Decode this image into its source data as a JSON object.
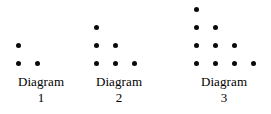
{
  "figure": {
    "background_color": "#ffffff",
    "dot_color": "#0a0a0a",
    "dot_diameter_px": 5,
    "row_spacing_px": 18,
    "column_spacing_px": 19,
    "caption_label": "Diagram",
    "diagrams": [
      {
        "name": "diagram-1",
        "caption_word": "Diagram",
        "caption_number": "1",
        "origin_x": 18,
        "rows": [
          {
            "count": 1,
            "y": 45,
            "xs": [
              18
            ]
          },
          {
            "count": 2,
            "y": 63,
            "xs": [
              18,
              37
            ]
          }
        ],
        "total_dots": 3
      },
      {
        "name": "diagram-2",
        "caption_word": "Diagram",
        "caption_number": "2",
        "origin_x": 96,
        "rows": [
          {
            "count": 1,
            "y": 27,
            "xs": [
              96
            ]
          },
          {
            "count": 2,
            "y": 45,
            "xs": [
              96,
              115
            ]
          },
          {
            "count": 3,
            "y": 63,
            "xs": [
              96,
              115,
              134
            ]
          }
        ],
        "total_dots": 6
      },
      {
        "name": "diagram-3",
        "caption_word": "Diagram",
        "caption_number": "3",
        "origin_x": 196,
        "rows": [
          {
            "count": 1,
            "y": 9,
            "xs": [
              196
            ]
          },
          {
            "count": 2,
            "y": 27,
            "xs": [
              196,
              215
            ]
          },
          {
            "count": 3,
            "y": 45,
            "xs": [
              196,
              215,
              234
            ]
          },
          {
            "count": 4,
            "y": 63,
            "xs": [
              196,
              215,
              234,
              253
            ]
          }
        ],
        "total_dots": 10
      }
    ],
    "caption_zones": [
      {
        "name": "caption-1",
        "left": 0,
        "width": 82
      },
      {
        "name": "caption-2",
        "left": 78,
        "width": 82
      },
      {
        "name": "caption-3",
        "left": 178,
        "width": 92
      }
    ]
  }
}
